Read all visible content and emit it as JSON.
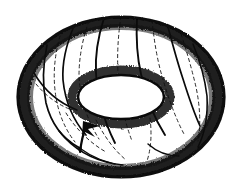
{
  "figure": {
    "title": "Torus with oriented meridian curve",
    "style": "pen-and-ink line drawing with stippled shading",
    "background_color": "#ffffff",
    "ink_color": "#0a0a0a",
    "hidden_line_color": "#2b2b2b"
  },
  "geometry": {
    "canvas": {
      "width": 240,
      "height": 193
    },
    "outer_boundary": {
      "name": "torus-outer-silhouette",
      "type": "ellipse",
      "cx": 121,
      "cy": 97,
      "rx": 104,
      "ry": 81
    },
    "inner_hole": {
      "name": "torus-inner-hole",
      "type": "ellipse",
      "cx": 121,
      "cy": 97,
      "rx": 43,
      "ry": 22,
      "fill": "#ffffff"
    },
    "meridian_count_visible": 8,
    "meridian_count_hidden": 8
  },
  "arrow": {
    "label": "meridian-orientation-arrow",
    "tip_x": 84,
    "tip_y": 122,
    "tail_x": 80,
    "tail_y": 152,
    "direction": "up-left"
  },
  "curves": {
    "solid_meridians": [
      "M 47 45 C 44 64, 43 84, 47 103 C 52 122, 63 137, 78 146",
      "M 74 26 C 66 45, 62 64, 63 80 C 65 100, 73 119, 86 134",
      "M 104 18 C 98 37, 95 56, 96 73 C 97 96, 104 120, 115 142",
      "M 137 18 C 136 38, 137 57, 141 74 C 146 96, 154 117, 165 134",
      "M 168 27 C 172 46, 177 64, 182 79 C 188 98, 194 114, 199 124",
      "M 192 43 C 199 60, 204 78, 206 95 C 208 114, 205 132, 198 146",
      "M 78 146 C 92 157, 108 163, 121 164",
      "M 59 132 C 72 149, 92 160, 114 164"
    ],
    "dashed_meridians": [
      "M 60 36 C 55 54, 53 72, 55 90 C 57 110, 64 128, 75 142",
      "M 89 21 C 82 40, 79 59, 79 76 C 80 98, 87 120, 99 139",
      "M 121 16 C 118 36, 117 55, 118 73 C 119 96, 124 120, 132 141",
      "M 152 20 C 154 40, 157 59, 162 76 C 168 97, 175 117, 184 134",
      "M 181 34 C 187 52, 192 70, 196 87 C 200 106, 201 125, 198 141",
      "M 66 113 C 76 129, 90 143, 106 152",
      "M 96 120 C 104 136, 114 150, 126 160",
      "M 150 118 C 152 134, 151 149, 147 161"
    ]
  }
}
